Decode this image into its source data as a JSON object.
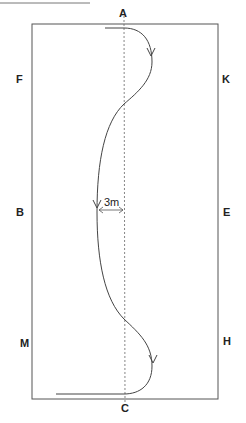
{
  "diagram": {
    "type": "dressage-arena-figure",
    "markers": {
      "top": "A",
      "bottom": "C",
      "left_upper": "F",
      "left_middle": "B",
      "left_lower": "M",
      "right_upper": "K",
      "right_middle": "E",
      "right_lower": "H"
    },
    "dimension_label": "3m",
    "colors": {
      "arena_border": "#555555",
      "path": "#444444",
      "centerline": "#666666",
      "text": "#222222"
    }
  }
}
